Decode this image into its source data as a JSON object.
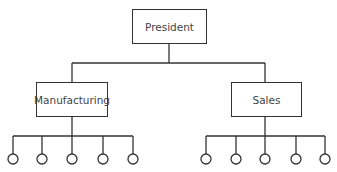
{
  "diagram": {
    "type": "org-chart",
    "root": {
      "label": "President"
    },
    "departments": [
      {
        "label": "Manufacturing",
        "subordinates": 5
      },
      {
        "label": "Sales",
        "subordinates": 5
      }
    ],
    "colors": {
      "line": "#333333",
      "text": "#444444",
      "background": "#ffffff"
    }
  }
}
